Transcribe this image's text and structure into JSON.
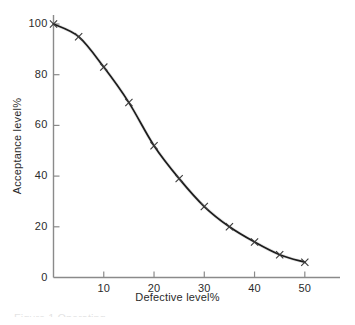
{
  "figure": {
    "background_color": "#ffffff",
    "axis_color": "#8a8a8a",
    "curve_color": "#1c1c1c",
    "marker_color": "#3a3a3a",
    "text_color": "#2b2b2b",
    "caption_fragment": "Figure 1 Operating"
  },
  "chart_data": {
    "type": "line",
    "title": "",
    "subtitle": "",
    "xlabel": "Defective level%",
    "ylabel": "Acceptance level%",
    "xlim": [
      0,
      57
    ],
    "ylim": [
      0,
      103
    ],
    "xticks": [
      10,
      20,
      30,
      40,
      50
    ],
    "yticks": [
      0,
      20,
      40,
      60,
      80,
      100
    ],
    "xtick_labels": [
      "10",
      "20",
      "30",
      "40",
      "50"
    ],
    "ytick_labels": [
      "0",
      "20",
      "40",
      "60",
      "80",
      "100"
    ],
    "grid": false,
    "legend": null,
    "legend_position": "none",
    "marker": "x",
    "line_style": "solid",
    "x": [
      0,
      5,
      10,
      15,
      20,
      25,
      30,
      35,
      40,
      45,
      50
    ],
    "values": [
      100,
      95,
      83,
      69,
      52,
      39,
      28,
      20,
      14,
      9,
      6
    ],
    "series": [
      {
        "name": "Acceptance level",
        "x": [
          0,
          5,
          10,
          15,
          20,
          25,
          30,
          35,
          40,
          45,
          50
        ],
        "values": [
          100,
          95,
          83,
          69,
          52,
          39,
          28,
          20,
          14,
          9,
          6
        ]
      }
    ],
    "annotations": []
  }
}
